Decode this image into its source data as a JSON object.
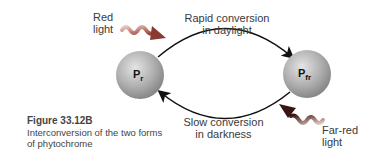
{
  "figure": {
    "number": "Figure 33.12B",
    "caption": "Interconversion of the two forms of phytochrome"
  },
  "nodes": [
    {
      "id": "pr",
      "label_main": "P",
      "label_sub": "r"
    },
    {
      "id": "pfr",
      "label_main": "P",
      "label_sub": "fr"
    }
  ],
  "arrows": {
    "top": {
      "line1": "Rapid conversion",
      "line2": "in daylight"
    },
    "bottom": {
      "line1": "Slow conversion",
      "line2": "in darkness"
    }
  },
  "light_inputs": {
    "red": {
      "line1": "Red",
      "line2": "light",
      "color": "#c0504d"
    },
    "far_red": {
      "line1": "Far-red",
      "line2": "light",
      "color": "#8b2e2e"
    }
  },
  "colors": {
    "sphere_light": "#d9d9d9",
    "sphere_dark": "#8a8a8a",
    "arrow": "#111111"
  }
}
